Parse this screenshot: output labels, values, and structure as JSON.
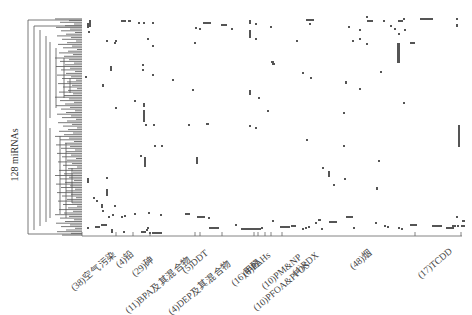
{
  "chart_data": {
    "type": "heatmap",
    "title": "",
    "ylabel": "128 miRNAs",
    "xlabel": "",
    "rows": 128,
    "dendrogram": "row hierarchical clustering tree on left",
    "colors": {
      "mark": "#555555",
      "background": "#ffffff",
      "tree": "#444444",
      "axis": "#555555"
    },
    "groups": [
      {
        "label": "(38)空气污染",
        "count": 38
      },
      {
        "label": "(4)铅",
        "count": 4
      },
      {
        "label": "(29)砷",
        "count": 29
      },
      {
        "label": "(11)BPA及其混合物",
        "count": 11
      },
      {
        "label": "(5)DDT",
        "count": 5
      },
      {
        "label": "(4)DEP及其混合物",
        "count": 4
      },
      {
        "label": "(16)甲醛",
        "count": 16
      },
      {
        "label": "(8)PAHs",
        "count": 8
      },
      {
        "label": "(10)PM&NP",
        "count": 10
      },
      {
        "label": "(10)PFOA&PFOS",
        "count": 10
      },
      {
        "label": "(4)RDX",
        "count": 4
      },
      {
        "label": "(48)烟",
        "count": 48
      },
      {
        "label": "(17)TCDD",
        "count": 17
      }
    ],
    "group_tick_x": [
      82,
      116,
      133,
      150,
      195,
      200,
      222,
      254,
      258,
      265,
      271,
      282,
      415,
      461
    ],
    "marks_px": [
      [
        87,
        23,
        2,
        5
      ],
      [
        89,
        20,
        2,
        7
      ],
      [
        121,
        20,
        5,
        2
      ],
      [
        128,
        20,
        3,
        2
      ],
      [
        138,
        22,
        2,
        2
      ],
      [
        143,
        22,
        2,
        2
      ],
      [
        152,
        22,
        2,
        2
      ],
      [
        88,
        31,
        2,
        2
      ],
      [
        106,
        40,
        2,
        2
      ],
      [
        115,
        40,
        2,
        2
      ],
      [
        147,
        38,
        2,
        2
      ],
      [
        152,
        45,
        2,
        2
      ],
      [
        195,
        27,
        2,
        2
      ],
      [
        199,
        28,
        2,
        2
      ],
      [
        203,
        22,
        8,
        2
      ],
      [
        221,
        24,
        6,
        2
      ],
      [
        231,
        28,
        2,
        2
      ],
      [
        249,
        20,
        2,
        4
      ],
      [
        249,
        30,
        2,
        8
      ],
      [
        255,
        23,
        2,
        2
      ],
      [
        255,
        38,
        2,
        2
      ],
      [
        270,
        26,
        2,
        2
      ],
      [
        114,
        42,
        2,
        2
      ],
      [
        194,
        42,
        2,
        2
      ],
      [
        110,
        66,
        2,
        5
      ],
      [
        85,
        76,
        2,
        2
      ],
      [
        142,
        64,
        2,
        2
      ],
      [
        142,
        69,
        2,
        2
      ],
      [
        152,
        74,
        2,
        2
      ],
      [
        102,
        84,
        2,
        3
      ],
      [
        172,
        79,
        2,
        2
      ],
      [
        192,
        89,
        2,
        2
      ],
      [
        249,
        90,
        2,
        5
      ],
      [
        258,
        97,
        2,
        2
      ],
      [
        272,
        63,
        3,
        2
      ],
      [
        271,
        61,
        3,
        2
      ],
      [
        134,
        100,
        2,
        2
      ],
      [
        115,
        107,
        2,
        2
      ],
      [
        143,
        103,
        2,
        4
      ],
      [
        143,
        110,
        2,
        12
      ],
      [
        145,
        124,
        2,
        2
      ],
      [
        153,
        124,
        2,
        2
      ],
      [
        206,
        123,
        3,
        2
      ],
      [
        249,
        125,
        2,
        2
      ],
      [
        255,
        127,
        2,
        2
      ],
      [
        306,
        19,
        8,
        2
      ],
      [
        309,
        23,
        2,
        2
      ],
      [
        296,
        40,
        2,
        2
      ],
      [
        348,
        26,
        2,
        2
      ],
      [
        359,
        29,
        2,
        2
      ],
      [
        359,
        38,
        2,
        2
      ],
      [
        352,
        40,
        2,
        2
      ],
      [
        366,
        43,
        2,
        2
      ],
      [
        366,
        16,
        2,
        2
      ],
      [
        367,
        20,
        6,
        2
      ],
      [
        383,
        20,
        2,
        2
      ],
      [
        390,
        25,
        2,
        2
      ],
      [
        394,
        28,
        2,
        2
      ],
      [
        398,
        20,
        5,
        2
      ],
      [
        403,
        18,
        2,
        2
      ],
      [
        398,
        33,
        2,
        2
      ],
      [
        410,
        42,
        5,
        2
      ],
      [
        397,
        43,
        3,
        20
      ],
      [
        404,
        29,
        2,
        2
      ],
      [
        420,
        18,
        13,
        2
      ],
      [
        456,
        18,
        2,
        2
      ],
      [
        456,
        24,
        2,
        3
      ],
      [
        302,
        72,
        2,
        2
      ],
      [
        310,
        77,
        2,
        2
      ],
      [
        345,
        81,
        2,
        3
      ],
      [
        359,
        88,
        2,
        2
      ],
      [
        380,
        71,
        2,
        2
      ],
      [
        403,
        102,
        2,
        2
      ],
      [
        343,
        112,
        2,
        2
      ],
      [
        458,
        125,
        2,
        22
      ],
      [
        343,
        145,
        2,
        2
      ],
      [
        344,
        178,
        2,
        2
      ],
      [
        306,
        139,
        2,
        2
      ],
      [
        322,
        167,
        2,
        2
      ],
      [
        328,
        171,
        2,
        6
      ],
      [
        333,
        184,
        2,
        2
      ],
      [
        376,
        187,
        2,
        3
      ],
      [
        144,
        157,
        2,
        10
      ],
      [
        140,
        155,
        2,
        2
      ],
      [
        196,
        157,
        2,
        7
      ],
      [
        154,
        145,
        2,
        2
      ],
      [
        161,
        145,
        2,
        2
      ],
      [
        188,
        124,
        2,
        2
      ],
      [
        87,
        178,
        2,
        5
      ],
      [
        106,
        177,
        2,
        2
      ],
      [
        106,
        189,
        2,
        7
      ],
      [
        96,
        200,
        2,
        2
      ],
      [
        93,
        197,
        2,
        2
      ],
      [
        101,
        204,
        2,
        4
      ],
      [
        102,
        210,
        2,
        2
      ],
      [
        114,
        205,
        2,
        2
      ],
      [
        112,
        214,
        2,
        2
      ],
      [
        108,
        216,
        2,
        2
      ],
      [
        121,
        216,
        2,
        2
      ],
      [
        124,
        215,
        2,
        2
      ],
      [
        134,
        213,
        2,
        2
      ],
      [
        148,
        212,
        2,
        2
      ],
      [
        160,
        214,
        2,
        2
      ],
      [
        185,
        213,
        5,
        2
      ],
      [
        197,
        216,
        8,
        2
      ],
      [
        208,
        217,
        2,
        2
      ],
      [
        87,
        227,
        2,
        2
      ],
      [
        95,
        226,
        5,
        2
      ],
      [
        101,
        224,
        6,
        2
      ],
      [
        111,
        229,
        2,
        4
      ],
      [
        123,
        231,
        2,
        2
      ],
      [
        141,
        231,
        5,
        2
      ],
      [
        146,
        229,
        2,
        2
      ],
      [
        147,
        227,
        2,
        2
      ],
      [
        149,
        232,
        2,
        2
      ],
      [
        152,
        232,
        10,
        2
      ],
      [
        209,
        227,
        10,
        2
      ],
      [
        235,
        224,
        2,
        2
      ],
      [
        241,
        228,
        10,
        2
      ],
      [
        251,
        228,
        10,
        2
      ],
      [
        261,
        227,
        2,
        2
      ],
      [
        272,
        220,
        2,
        2
      ],
      [
        280,
        226,
        10,
        2
      ],
      [
        291,
        225,
        5,
        2
      ],
      [
        302,
        228,
        2,
        2
      ],
      [
        305,
        227,
        2,
        2
      ],
      [
        308,
        226,
        2,
        2
      ],
      [
        315,
        222,
        2,
        2
      ],
      [
        321,
        228,
        2,
        2
      ],
      [
        318,
        219,
        3,
        2
      ],
      [
        329,
        221,
        8,
        2
      ],
      [
        346,
        216,
        7,
        2
      ],
      [
        353,
        227,
        2,
        2
      ],
      [
        375,
        222,
        2,
        2
      ],
      [
        384,
        225,
        2,
        2
      ],
      [
        387,
        226,
        2,
        2
      ],
      [
        398,
        227,
        2,
        2
      ],
      [
        401,
        228,
        2,
        2
      ],
      [
        410,
        224,
        7,
        2
      ],
      [
        432,
        225,
        10,
        2
      ],
      [
        446,
        227,
        8,
        2
      ],
      [
        452,
        225,
        4,
        2
      ],
      [
        457,
        225,
        2,
        2
      ],
      [
        461,
        225,
        4,
        2
      ],
      [
        267,
        110,
        2,
        2
      ],
      [
        378,
        160,
        2,
        2
      ],
      [
        456,
        216,
        2,
        2
      ],
      [
        462,
        220,
        3,
        2
      ]
    ]
  }
}
